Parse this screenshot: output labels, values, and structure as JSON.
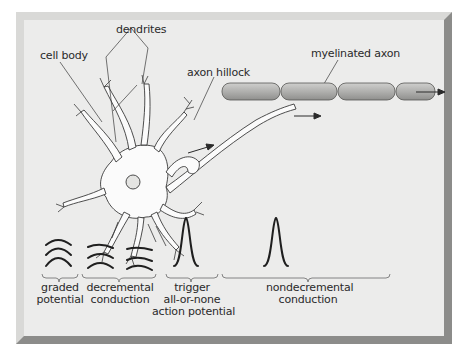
{
  "figure": {
    "labels": {
      "dendrites": "dendrites",
      "cell_body": "cell body",
      "axon_hillock": "axon hillock",
      "myelinated_axon": "myelinated axon"
    },
    "stages": [
      {
        "line1": "graded",
        "line2": "potential",
        "line3": ""
      },
      {
        "line1": "decremental",
        "line2": "conduction",
        "line3": ""
      },
      {
        "line1": "trigger",
        "line2": "all-or-none",
        "line3": "action potential"
      },
      {
        "line1": "nondecremental",
        "line2": "conduction",
        "line3": ""
      }
    ],
    "colors": {
      "panel": "#ebebea",
      "bevel_light": "#d6d6d4",
      "bevel_dark": "#8e8e8c",
      "ink": "#1f1f1f",
      "myelin": "#b3b3b1"
    }
  }
}
